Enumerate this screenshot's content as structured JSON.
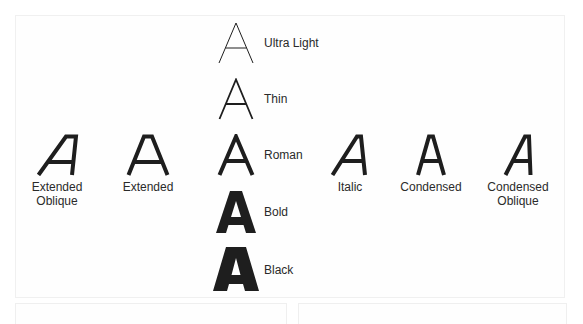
{
  "diagram": {
    "title": "",
    "glyph": "A",
    "weights": [
      {
        "label": "Ultra Light"
      },
      {
        "label": "Thin"
      },
      {
        "label": "Roman"
      },
      {
        "label": "Bold"
      },
      {
        "label": "Black"
      }
    ],
    "widths": [
      {
        "label_line1": "Extended",
        "label_line2": "Oblique"
      },
      {
        "label_line1": "Extended",
        "label_line2": ""
      },
      {
        "label_line1": "Italic",
        "label_line2": ""
      },
      {
        "label_line1": "Condensed",
        "label_line2": ""
      },
      {
        "label_line1": "Condensed",
        "label_line2": "Oblique"
      }
    ],
    "colors": {
      "ink": "#1e1e1e",
      "panel_border": "#f0f0f0",
      "background": "#ffffff"
    }
  }
}
